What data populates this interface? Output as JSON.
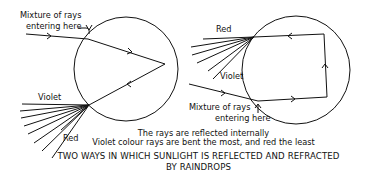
{
  "left_diagram": {
    "entry_label_line1": "Mixture of rays",
    "entry_label_line2": "entering here",
    "violet_label": "Violet",
    "red_label": "Red"
  },
  "right_diagram": {
    "red_label": "Red",
    "violet_label": "Violet",
    "entry_label_line1": "Mixture of rays",
    "entry_label_line2": "entering here"
  },
  "caption": {
    "line1": "The rays are reflected internally",
    "line2": "Violet colour rays are bent the most, and red the least"
  },
  "title": {
    "line1": "TWO WAYS IN WHICH SUNLIGHT IS REFLECTED AND REFRACTED",
    "line2": "BY RAINDROPS"
  },
  "colors": {
    "ink": "#111111",
    "background": "#ffffff"
  }
}
